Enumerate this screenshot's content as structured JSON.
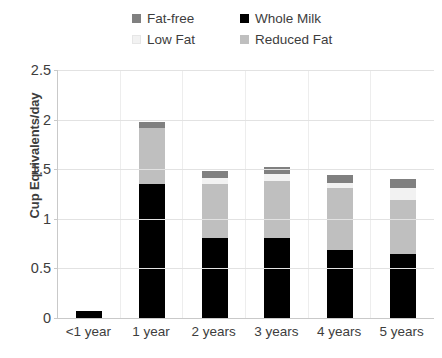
{
  "chart_data": {
    "type": "bar",
    "stacked": true,
    "title": "",
    "xlabel": "",
    "ylabel": "Cup Equivalents/day",
    "ylim": [
      0,
      2.5
    ],
    "yticks": [
      "0",
      "0.5",
      "1",
      "1.5",
      "2",
      "2.5"
    ],
    "ytick_values": [
      0,
      0.5,
      1,
      1.5,
      2,
      2.5
    ],
    "grid": true,
    "legend_position": "top-center",
    "categories": [
      "<1 year",
      "1 year",
      "2 years",
      "3 years",
      "4 years",
      "5 years"
    ],
    "series": [
      {
        "name": "Whole Milk",
        "color": "#000000",
        "values": [
          0.07,
          1.35,
          0.81,
          0.81,
          0.69,
          0.65
        ]
      },
      {
        "name": "Reduced Fat",
        "color": "#bfbfbf",
        "values": [
          0.0,
          0.57,
          0.54,
          0.57,
          0.62,
          0.54
        ]
      },
      {
        "name": "Low Fat",
        "color": "#f2f2f2",
        "values": [
          0.0,
          0.0,
          0.06,
          0.07,
          0.05,
          0.12
        ]
      },
      {
        "name": "Fat-free",
        "color": "#808080",
        "values": [
          0.0,
          0.06,
          0.07,
          0.07,
          0.08,
          0.09
        ]
      }
    ],
    "totals": [
      0.07,
      1.98,
      1.48,
      1.52,
      1.44,
      1.4
    ]
  },
  "legend": {
    "items": [
      {
        "label": "Fat-free",
        "color": "#808080"
      },
      {
        "label": "Whole Milk",
        "color": "#000000"
      },
      {
        "label": "Low Fat",
        "color": "#f2f2f2"
      },
      {
        "label": "Reduced Fat",
        "color": "#bfbfbf"
      }
    ]
  },
  "axes": {
    "y_title": "Cup Equivalents/day"
  }
}
